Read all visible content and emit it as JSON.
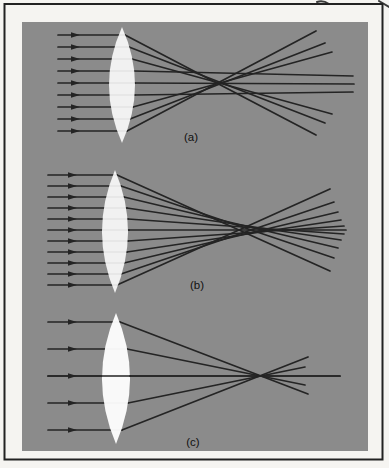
{
  "figure": {
    "type": "optics-ray-diagram",
    "page_background": "#f5f4f1",
    "panel_background": "#8b8b8b",
    "frame_color": "#222222",
    "ray_color": "#242424",
    "lens_color": "#ffffff",
    "label_color": "#111111"
  },
  "panels": [
    {
      "id": "a",
      "label": "(a)",
      "label_x": 191,
      "label_y": 141,
      "axis_y": 83,
      "ray_start_x": 58,
      "arrow_x": 76,
      "lens": {
        "cx": 122,
        "top": 27,
        "bottom": 143,
        "half_width": 13,
        "opacity": 0.88
      },
      "rays": [
        {
          "y": 35,
          "sx": 125,
          "ex": 316,
          "ey": 135
        },
        {
          "y": 47,
          "sx": 129,
          "ex": 325,
          "ey": 123
        },
        {
          "y": 59,
          "sx": 132,
          "ex": 332,
          "ey": 114
        },
        {
          "y": 71,
          "sx": 134,
          "ex": 353,
          "ey": 76
        },
        {
          "y": 83,
          "sx": 135,
          "ex": 354,
          "ey": 84
        },
        {
          "y": 95,
          "sx": 135,
          "ex": 353,
          "ey": 92
        },
        {
          "y": 107,
          "sx": 133,
          "ex": 332,
          "ey": 52
        },
        {
          "y": 119,
          "sx": 130,
          "ex": 325,
          "ey": 43
        },
        {
          "y": 131,
          "sx": 127,
          "ex": 316,
          "ey": 31
        }
      ]
    },
    {
      "id": "b",
      "label": "(b)",
      "label_x": 197,
      "label_y": 289,
      "axis_y": 230,
      "ray_start_x": 48,
      "arrow_x": 73,
      "lens": {
        "cx": 115,
        "top": 170,
        "bottom": 293,
        "half_width": 13,
        "opacity": 0.88
      },
      "rays": [
        {
          "y": 175,
          "sx": 117,
          "ex": 330,
          "ey": 271
        },
        {
          "y": 186,
          "sx": 121,
          "ex": 334,
          "ey": 258
        },
        {
          "y": 197,
          "sx": 124,
          "ex": 338,
          "ey": 248
        },
        {
          "y": 208,
          "sx": 127,
          "ex": 341,
          "ey": 240
        },
        {
          "y": 219,
          "sx": 128,
          "ex": 344,
          "ey": 234
        },
        {
          "y": 230,
          "sx": 129,
          "ex": 346,
          "ey": 230
        },
        {
          "y": 241,
          "sx": 128,
          "ex": 344,
          "ey": 226
        },
        {
          "y": 252,
          "sx": 127,
          "ex": 341,
          "ey": 220
        },
        {
          "y": 263,
          "sx": 124,
          "ex": 338,
          "ey": 212
        },
        {
          "y": 274,
          "sx": 121,
          "ex": 334,
          "ey": 202
        },
        {
          "y": 285,
          "sx": 117,
          "ex": 330,
          "ey": 189
        }
      ]
    },
    {
      "id": "c",
      "label": "(c)",
      "label_x": 193,
      "label_y": 446,
      "axis_y": 376,
      "ray_start_x": 48,
      "arrow_x": 73,
      "redraw_ray_index": 2,
      "lens": {
        "cx": 116,
        "top": 313,
        "bottom": 444,
        "half_width": 14,
        "opacity": 0.95
      },
      "rays": [
        {
          "y": 322,
          "sx": 120,
          "ex": 308,
          "ey": 394
        },
        {
          "y": 349,
          "sx": 127,
          "ex": 305,
          "ey": 385
        },
        {
          "y": 376,
          "sx": 130,
          "ex": 340,
          "ey": 376
        },
        {
          "y": 403,
          "sx": 128,
          "ex": 305,
          "ey": 367
        },
        {
          "y": 430,
          "sx": 122,
          "ex": 308,
          "ey": 357
        }
      ]
    }
  ]
}
